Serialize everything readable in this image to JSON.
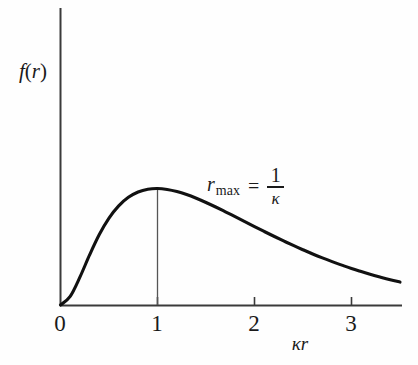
{
  "chart_data": {
    "type": "line",
    "title": "",
    "xlabel": "κr",
    "ylabel": "f(r)",
    "xlim": [
      -0.12,
      3.5
    ],
    "ylim": [
      0,
      1.18
    ],
    "grid": false,
    "legend": null,
    "xticks": [
      0,
      1,
      2,
      3
    ],
    "xticklabels": [
      "0",
      "1",
      "2",
      "3"
    ],
    "yticks": [],
    "yticklabels": [],
    "series": [
      {
        "name": "f(r)",
        "description": "radial probability density, peak at κr = 1",
        "x": [
          0.0,
          0.1,
          0.2,
          0.3,
          0.4,
          0.5,
          0.6,
          0.7,
          0.8,
          0.9,
          1.0,
          1.1,
          1.2,
          1.3,
          1.4,
          1.5,
          1.6,
          1.7,
          1.8,
          1.9,
          2.0,
          2.1,
          2.2,
          2.3,
          2.4,
          2.5,
          2.6,
          2.7,
          2.8,
          2.9,
          3.0,
          3.1,
          3.2,
          3.3,
          3.4,
          3.5
        ],
        "y": [
          0.0,
          0.074,
          0.239,
          0.43,
          0.605,
          0.746,
          0.851,
          0.924,
          0.97,
          0.994,
          1.0,
          0.992,
          0.974,
          0.948,
          0.916,
          0.88,
          0.841,
          0.8,
          0.758,
          0.716,
          0.673,
          0.631,
          0.59,
          0.55,
          0.511,
          0.474,
          0.438,
          0.404,
          0.372,
          0.342,
          0.313,
          0.287,
          0.262,
          0.239,
          0.217,
          0.197
        ]
      }
    ],
    "annotations": [
      {
        "name": "r-max-annotation",
        "symbol": "r",
        "subscript": "max",
        "equals": "=",
        "numerator": "1",
        "denominator": "κ",
        "text": "r_max = 1/κ",
        "at_x": 1.52,
        "at_y": 0.98
      }
    ],
    "markers": [
      {
        "name": "peak-drop-line",
        "type": "vertical-line",
        "x": 1.0,
        "y_from": 0.0,
        "y_to": 1.0
      }
    ]
  },
  "axes": {
    "x_axis_name": "x-axis",
    "y_axis_name": "y-axis",
    "tick_label_0": "0",
    "tick_label_1": "1",
    "tick_label_2": "2",
    "tick_label_3": "3"
  },
  "labels": {
    "y_axis_label_f": "f",
    "y_axis_label_open": "(",
    "y_axis_label_r": "r",
    "y_axis_label_close": ")",
    "x_axis_label_kappa": "κ",
    "x_axis_label_r": "r"
  },
  "colors": {
    "background": "#fefefe",
    "curve": "#111111",
    "axis": "#3a3a3a",
    "text": "#1a1a1a",
    "dropline": "#555555"
  }
}
